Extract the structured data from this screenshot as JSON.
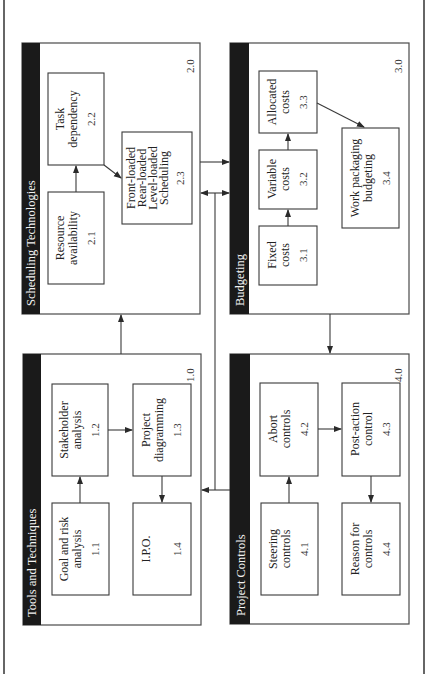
{
  "diagram": {
    "orientation": "rotated-90-ccw",
    "colors": {
      "header_bg": "#1a1a1a",
      "header_text": "#f2f2f2",
      "line": "#3a3a3a",
      "background": "#ffffff"
    },
    "groups": [
      {
        "id": "2.0",
        "title": "Scheduling Technologies",
        "items": [
          {
            "id": "2.1",
            "lines": [
              "Resource",
              "availability"
            ]
          },
          {
            "id": "2.2",
            "lines": [
              "Task",
              "dependency"
            ]
          },
          {
            "id": "2.3",
            "lines": [
              "Front-loaded",
              "Rear-loaded",
              "Level-loaded",
              "Scheduling"
            ]
          }
        ]
      },
      {
        "id": "3.0",
        "title": "Budgeting",
        "items": [
          {
            "id": "3.1",
            "lines": [
              "Fixed",
              "costs"
            ]
          },
          {
            "id": "3.2",
            "lines": [
              "Variable",
              "costs"
            ]
          },
          {
            "id": "3.3",
            "lines": [
              "Allocated",
              "costs"
            ]
          },
          {
            "id": "3.4",
            "lines": [
              "Work packaging",
              "budgeting"
            ]
          }
        ]
      },
      {
        "id": "1.0",
        "title": "Tools and Techniques",
        "items": [
          {
            "id": "1.1",
            "lines": [
              "Goal and risk",
              "analysis"
            ]
          },
          {
            "id": "1.2",
            "lines": [
              "Stakeholder",
              "analysis"
            ]
          },
          {
            "id": "1.3",
            "lines": [
              "Project",
              "diagramming"
            ]
          },
          {
            "id": "1.4",
            "lines": [
              "I.P.O."
            ]
          }
        ]
      },
      {
        "id": "4.0",
        "title": "Project Controls",
        "items": [
          {
            "id": "4.1",
            "lines": [
              "Steering",
              "controls"
            ]
          },
          {
            "id": "4.2",
            "lines": [
              "Abort",
              "controls"
            ]
          },
          {
            "id": "4.3",
            "lines": [
              "Post-action",
              "control"
            ]
          },
          {
            "id": "4.4",
            "lines": [
              "Reason for",
              "controls"
            ]
          }
        ]
      }
    ],
    "edges": [
      {
        "from": "2.1",
        "to": "2.2"
      },
      {
        "from": "2.2",
        "to": "2.3"
      },
      {
        "from": "3.1",
        "to": "3.2"
      },
      {
        "from": "3.2",
        "to": "3.3"
      },
      {
        "from": "3.3",
        "to": "3.4"
      },
      {
        "from": "1.1",
        "to": "1.2"
      },
      {
        "from": "1.2",
        "to": "1.3"
      },
      {
        "from": "1.3",
        "to": "1.4"
      },
      {
        "from": "4.1",
        "to": "4.2"
      },
      {
        "from": "4.2",
        "to": "4.3"
      },
      {
        "from": "4.3",
        "to": "4.4"
      },
      {
        "from": "1.0",
        "to": "2.0"
      },
      {
        "from": "2.0",
        "to": "3.0"
      },
      {
        "from": "2.0",
        "to": "3.0",
        "bidirectional": true
      },
      {
        "from": "3.0",
        "to": "4.0"
      },
      {
        "from": "4.0",
        "to": "1.0"
      }
    ]
  }
}
